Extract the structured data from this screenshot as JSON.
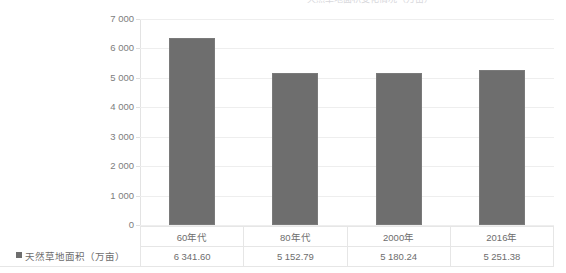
{
  "chart_data": {
    "type": "bar",
    "title": "天然草地面积变化情况（万亩）",
    "title_visible": false,
    "xlabel": "",
    "ylabel": "",
    "categories": [
      "60年代",
      "80年代",
      "2000年",
      "2016年"
    ],
    "series": [
      {
        "name": "天然草地面积（万亩）",
        "values": [
          6341.6,
          5152.79,
          5180.24,
          5251.38
        ],
        "value_labels": [
          "6 341.60",
          "5 152.79",
          "5 180.24",
          "5 251.38"
        ],
        "color": "#6e6e6e"
      }
    ],
    "ylim": [
      0,
      7000
    ],
    "ytick_values": [
      7000,
      6000,
      5000,
      4000,
      3000,
      2000,
      1000,
      0
    ],
    "ytick_labels": [
      "7 000",
      "6 000",
      "5 000",
      "4 000",
      "3 000",
      "2 000",
      "1 000",
      "0"
    ],
    "grid": true,
    "grid_color": "#eeeeee",
    "legend_position": "bottom-table",
    "has_data_table": true
  },
  "legend": {
    "marker_color": "#6e6e6e",
    "label": "天然草地面积（万亩）"
  },
  "table": {
    "headers": [
      "60年代",
      "80年代",
      "2000年",
      "2016年"
    ],
    "row_label": "天然草地面积（万亩）",
    "values": [
      "6 341.60",
      "5 152.79",
      "5 180.24",
      "5 251.38"
    ]
  },
  "colors": {
    "bar": "#6e6e6e",
    "grid": "#eeeeee",
    "axis": "#e3e3e3",
    "text": "#6d6d6d",
    "background": "#ffffff"
  }
}
